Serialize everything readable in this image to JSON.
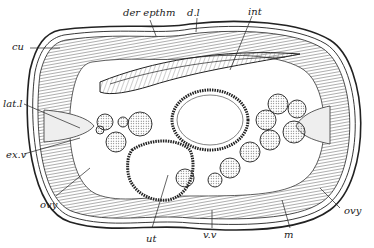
{
  "figure": {
    "labels": {
      "der_epthm": "der epthm",
      "dl": "d.l",
      "int": "int",
      "cu": "cu",
      "lat_l": "lat.l",
      "ex_v": "ex.v",
      "ovy_left": "ovy",
      "ovy_right": "ovy",
      "ut": "ut",
      "vv": "v.v",
      "m": "m"
    },
    "colors": {
      "ink": "#222222",
      "paper": "#ffffff",
      "tissue": "#dcdcdc"
    }
  }
}
